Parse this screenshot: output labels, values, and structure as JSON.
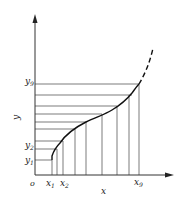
{
  "diagram": {
    "type": "curve-discretization",
    "axes": {
      "x_label": "x",
      "y_label": "y",
      "origin_label": "o"
    },
    "x_ticks": [
      {
        "label": "x",
        "sub": "1"
      },
      {
        "label": "x",
        "sub": "2"
      },
      {
        "label": "x",
        "sub": "9"
      }
    ],
    "y_ticks": [
      {
        "label": "y",
        "sub": "1"
      },
      {
        "label": "y",
        "sub": "2"
      },
      {
        "label": "y",
        "sub": "9"
      }
    ],
    "horizontal_lines_count": 9,
    "vertical_lines_count": 9,
    "colors": {
      "line": "#333333",
      "curve": "#111111",
      "background": "#ffffff"
    }
  }
}
